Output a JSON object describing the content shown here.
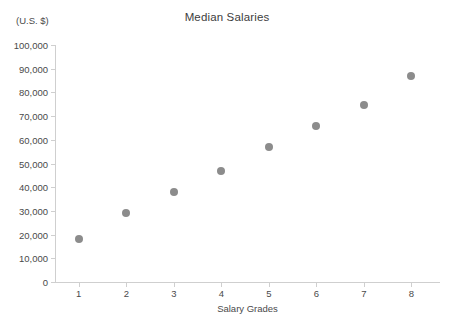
{
  "chart_data": {
    "type": "scatter",
    "title": "Median Salaries",
    "xlabel": "Salary Grades",
    "ylabel": "(U.S. $)",
    "unit_caption": "(U.S. $)",
    "x": [
      1,
      2,
      3,
      4,
      5,
      6,
      7,
      8
    ],
    "values": [
      18000,
      29000,
      38000,
      47000,
      57000,
      66000,
      74500,
      87000
    ],
    "series": [
      {
        "name": "Median Salary",
        "values": [
          18000,
          29000,
          38000,
          47000,
          57000,
          66000,
          74500,
          87000
        ]
      }
    ],
    "xlim": [
      0.5,
      8.6
    ],
    "ylim": [
      0,
      100000
    ],
    "xticks": [
      "1",
      "2",
      "3",
      "4",
      "5",
      "6",
      "7",
      "8"
    ],
    "yticks": [
      "0",
      "10,000",
      "20,000",
      "30,000",
      "40,000",
      "50,000",
      "60,000",
      "70,000",
      "80,000",
      "90,000",
      "100,000"
    ],
    "ytick_values": [
      0,
      10000,
      20000,
      30000,
      40000,
      50000,
      60000,
      70000,
      80000,
      90000,
      100000
    ],
    "grid": false,
    "legend": false,
    "marker_color": "#8c8c8c",
    "axis_color": "#cfcfcf",
    "text_color": "#4a4a4a",
    "background": "#ffffff"
  }
}
